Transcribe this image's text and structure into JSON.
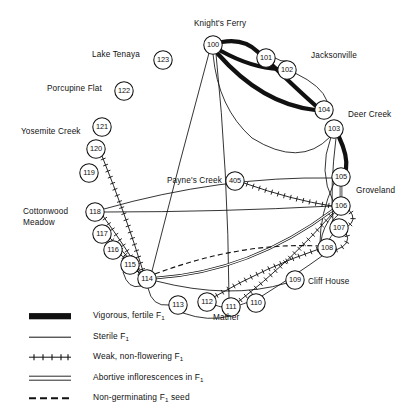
{
  "figure": {
    "type": "network-diagram"
  },
  "locality_labels": [
    {
      "id": "knights-ferry",
      "text": "Knight's Ferry",
      "x": 194,
      "y": 19,
      "align": "left"
    },
    {
      "id": "lake-tenaya",
      "text": "Lake Tenaya",
      "x": 92,
      "y": 50,
      "align": "left"
    },
    {
      "id": "jacksonville",
      "text": "Jacksonville",
      "x": 311,
      "y": 51,
      "align": "left"
    },
    {
      "id": "porcupine-flat",
      "text": "Porcupine Flat",
      "x": 47,
      "y": 84,
      "align": "left"
    },
    {
      "id": "deer-creek",
      "text": "Deer Creek",
      "x": 348,
      "y": 110,
      "align": "left"
    },
    {
      "id": "yosemite-creek",
      "text": "Yosemite Creek",
      "x": 21,
      "y": 127,
      "align": "left"
    },
    {
      "id": "paynes-creek",
      "text": "Payne's Creek",
      "x": 167,
      "y": 176,
      "align": "left"
    },
    {
      "id": "groveland",
      "text": "Groveland",
      "x": 356,
      "y": 186,
      "align": "left"
    },
    {
      "id": "cottonwood-meadow",
      "text": "Cottonwood\nMeadow",
      "x": 23,
      "y": 207,
      "align": "left"
    },
    {
      "id": "cliff-house",
      "text": "Cliff House",
      "x": 308,
      "y": 277,
      "align": "left"
    },
    {
      "id": "mather",
      "text": "Mather",
      "x": 213,
      "y": 313,
      "align": "left"
    }
  ],
  "nodes": [
    {
      "id": "100",
      "label": "100",
      "x": 213,
      "y": 45,
      "r": 9.2
    },
    {
      "id": "101",
      "label": "101",
      "x": 266,
      "y": 58,
      "r": 9.2
    },
    {
      "id": "102",
      "label": "102",
      "x": 287,
      "y": 70,
      "r": 9.2
    },
    {
      "id": "104",
      "label": "104",
      "x": 324,
      "y": 110,
      "r": 9.2
    },
    {
      "id": "103",
      "label": "103",
      "x": 334,
      "y": 129,
      "r": 9.2
    },
    {
      "id": "105",
      "label": "105",
      "x": 341,
      "y": 177,
      "r": 9.2
    },
    {
      "id": "106",
      "label": "106",
      "x": 341,
      "y": 206,
      "r": 9.2
    },
    {
      "id": "107",
      "label": "107",
      "x": 339,
      "y": 228,
      "r": 9.2
    },
    {
      "id": "108",
      "label": "108",
      "x": 327,
      "y": 248,
      "r": 9.2
    },
    {
      "id": "109",
      "label": "109",
      "x": 295,
      "y": 280,
      "r": 9.2
    },
    {
      "id": "110",
      "label": "110",
      "x": 256,
      "y": 303,
      "r": 9.2
    },
    {
      "id": "111",
      "label": "111",
      "x": 231,
      "y": 307,
      "r": 9.2
    },
    {
      "id": "112",
      "label": "112",
      "x": 207,
      "y": 302,
      "r": 9.2
    },
    {
      "id": "113",
      "label": "113",
      "x": 178,
      "y": 305,
      "r": 9.2
    },
    {
      "id": "114",
      "label": "114",
      "x": 147,
      "y": 279,
      "r": 9.2
    },
    {
      "id": "115",
      "label": "115",
      "x": 130,
      "y": 265,
      "r": 9.2
    },
    {
      "id": "116",
      "label": "116",
      "x": 113,
      "y": 250,
      "r": 9.2
    },
    {
      "id": "117",
      "label": "117",
      "x": 102,
      "y": 234,
      "r": 9.2
    },
    {
      "id": "118",
      "label": "118",
      "x": 95,
      "y": 212,
      "r": 9.2
    },
    {
      "id": "119",
      "label": "119",
      "x": 89,
      "y": 173,
      "r": 9.2
    },
    {
      "id": "120",
      "label": "120",
      "x": 96,
      "y": 149,
      "r": 9.2
    },
    {
      "id": "121",
      "label": "121",
      "x": 102,
      "y": 127,
      "r": 9.2
    },
    {
      "id": "122",
      "label": "122",
      "x": 124,
      "y": 91,
      "r": 9.2
    },
    {
      "id": "123",
      "label": "123",
      "x": 163,
      "y": 60,
      "r": 9.2
    },
    {
      "id": "405",
      "label": "405",
      "x": 235,
      "y": 181,
      "r": 9.2
    }
  ],
  "edges": [
    {
      "from": "100",
      "to": "101",
      "kind": "vigorous",
      "path": "M222,42 Q244,38 258,52"
    },
    {
      "from": "100",
      "to": "102",
      "kind": "vigorous",
      "path": "M221,51 Q252,68 279,69"
    },
    {
      "from": "100",
      "to": "104",
      "kind": "vigorous",
      "path": "M218,54 Q262,104 315,110"
    },
    {
      "from": "101",
      "to": "104",
      "kind": "vigorous",
      "path": "M272,65 Q300,92 316,106"
    },
    {
      "from": "103",
      "to": "105",
      "kind": "vigorous",
      "path": "M339,137 Q348,156 346,169"
    },
    {
      "from": "100",
      "to": "103",
      "kind": "sterile",
      "path": "M213,54 Q218,108 252,138 Q300,168 330,137"
    },
    {
      "from": "102",
      "to": "104",
      "kind": "sterile",
      "path": "M295,73 Q322,86 327,101"
    },
    {
      "from": "101",
      "to": "102",
      "kind": "sterile",
      "path": "M275,58 Q281,62 287,61"
    },
    {
      "from": "100",
      "to": "114",
      "kind": "sterile",
      "path": "M209,53 Q180,160 152,271"
    },
    {
      "from": "100",
      "to": "111",
      "kind": "sterile",
      "path": "M216,54 Q228,170 229,298"
    },
    {
      "from": "103",
      "to": "106",
      "kind": "sterile",
      "path": "M331,137 Q318,172 333,201"
    },
    {
      "from": "103",
      "to": "107",
      "kind": "sterile",
      "path": "M336,138 Q330,186 333,221"
    },
    {
      "from": "105",
      "to": "106",
      "kind": "abortive",
      "path": "M341,186 L341,197"
    },
    {
      "from": "105",
      "to": "108",
      "kind": "sterile",
      "path": "M334,183 Q320,214 320,243"
    },
    {
      "from": "106",
      "to": "107",
      "kind": "sterile",
      "path": "M338,215 Q331,221 332,223"
    },
    {
      "from": "106",
      "to": "108",
      "kind": "sterile",
      "path": "M334,213 Q322,228 321,242"
    },
    {
      "from": "107",
      "to": "108",
      "kind": "sterile",
      "path": "M333,234 Q328,240 330,240"
    },
    {
      "from": "105",
      "to": "118",
      "kind": "sterile",
      "path": "M332,178 Q220,176 104,209"
    },
    {
      "from": "118",
      "to": "106",
      "kind": "sterile",
      "path": "M104,212 Q220,212 332,206"
    },
    {
      "from": "114",
      "to": "106",
      "kind": "abortive",
      "path": "M156,278 Q250,272 333,210"
    },
    {
      "from": "114",
      "to": "108",
      "kind": "seed",
      "path": "M155,274 Q240,242 319,246"
    },
    {
      "from": "114",
      "to": "109",
      "kind": "sterile",
      "path": "M156,281 Q230,300 287,283"
    },
    {
      "from": "114",
      "to": "113",
      "kind": "sterile",
      "path": "M148,288 Q152,307 169,305"
    },
    {
      "from": "113",
      "to": "111",
      "kind": "sterile",
      "path": "M183,313 Q208,322 230,316"
    },
    {
      "from": "112",
      "to": "111",
      "kind": "sterile",
      "path": "M215,305 Q223,308 222,306"
    },
    {
      "from": "111",
      "to": "110",
      "kind": "sterile",
      "path": "M240,305 Q248,302 247,303"
    },
    {
      "from": "110",
      "to": "108",
      "kind": "sterile",
      "path": "M262,296 Q300,272 322,256"
    },
    {
      "from": "112",
      "to": "108",
      "kind": "weak",
      "path": "M214,297 Q268,266 319,249"
    },
    {
      "from": "111",
      "to": "106",
      "kind": "weak",
      "path": "M238,302 Q290,262 333,213"
    },
    {
      "from": "405",
      "to": "106",
      "kind": "weak",
      "path": "M244,183 Q292,200 332,206"
    },
    {
      "from": "120",
      "to": "114",
      "kind": "weak",
      "path": "M102,156 Q126,216 143,271"
    },
    {
      "from": "118",
      "to": "114",
      "kind": "weak",
      "path": "M103,216 Q126,248 141,273"
    },
    {
      "from": "117",
      "to": "114",
      "kind": "weak",
      "path": "M110,238 Q130,258 140,274"
    },
    {
      "from": "116",
      "to": "114",
      "kind": "weak",
      "path": "M121,255 Q134,266 139,273"
    },
    {
      "from": "115",
      "to": "114",
      "kind": "weak",
      "path": "M137,271 Q142,275 140,276"
    },
    {
      "from": "115",
      "to": "114b",
      "kind": "sterile",
      "path": "M123,272 Q128,290 141,286"
    },
    {
      "from": "107",
      "to": "108b",
      "kind": "weak",
      "path": "M346,233 Q352,244 336,250"
    },
    {
      "from": "106",
      "to": "107b",
      "kind": "weak",
      "path": "M349,210 Q358,220 347,227"
    }
  ],
  "legend": {
    "title": "",
    "items": [
      {
        "id": "vigorous",
        "swatch": "thick-bar",
        "text": "Vigorous, fertile F",
        "sub": "1",
        "after": ""
      },
      {
        "id": "sterile",
        "swatch": "thin-line",
        "text": "Sterile F",
        "sub": "1",
        "after": ""
      },
      {
        "id": "weak",
        "swatch": "crosshatch-line",
        "text": "Weak, non-flowering F",
        "sub": "1",
        "after": ""
      },
      {
        "id": "abortive",
        "swatch": "double-line",
        "text": "Abortive inflorescences in F",
        "sub": "1",
        "after": ""
      },
      {
        "id": "seed",
        "swatch": "dashed-line",
        "text": "Non-germinating F",
        "sub": "1",
        "after": " seed"
      }
    ]
  }
}
